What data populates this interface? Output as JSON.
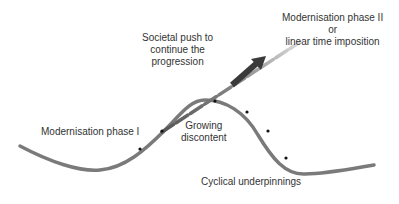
{
  "diagram": {
    "labels": {
      "push": [
        "Societal push to",
        "continue the",
        "progression"
      ],
      "phase2": [
        "Modernisation phase II",
        "or",
        "linear time imposition"
      ],
      "phase1": "Modernisation phase I",
      "discontent": [
        "Growing",
        "discontent"
      ],
      "cyclical": "Cyclical underpinnings"
    },
    "colors": {
      "curve": "#7a7a7a",
      "arrow": "#3a3a3a",
      "text": "#333333",
      "dots": "#111111"
    }
  }
}
